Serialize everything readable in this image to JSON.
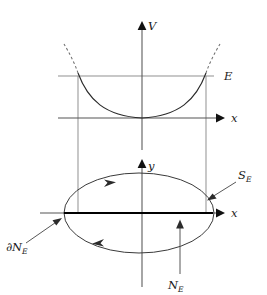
{
  "figure": {
    "name": "potential-well-and-energy-surface",
    "background_color": "#ffffff",
    "ink_color": "#1a1a1a",
    "width": 267,
    "height": 295
  },
  "upper_plot": {
    "name": "potential-energy-plot",
    "vertical_axis_label": "V",
    "horizontal_axis_label": "x",
    "energy_level_label": "E",
    "curve_name": "parabolic-potential",
    "curve_description": "upward-opening parabola with vertex at the origin",
    "dashed_extension": true,
    "origin": {
      "x": 142,
      "y": 118
    },
    "vertical_axis": {
      "x": 142,
      "y_top": 22,
      "y_bottom": 150
    },
    "horizontal_axis": {
      "y": 118,
      "x_left": 58,
      "x_right": 222
    },
    "energy_level_line": {
      "y": 76,
      "x_left": 58,
      "x_right": 214
    },
    "turning_points": {
      "left_x": 78,
      "right_x": 206
    }
  },
  "lower_plot": {
    "name": "configuration-space-plot",
    "vertical_axis_label": "y",
    "horizontal_axis_label": "x",
    "origin": {
      "x": 142,
      "y": 213
    },
    "vertical_axis": {
      "x": 142,
      "y_top": 160,
      "y_bottom": 287
    },
    "horizontal_axis": {
      "y": 213,
      "x_left": 40,
      "x_right": 222
    },
    "ellipse": {
      "name": "energy-surface-ellipse",
      "center_x": 139,
      "center_y": 213,
      "radius_x": 75,
      "radius_y": 40,
      "orientation": "clockwise",
      "top_arrow_direction": "right",
      "bottom_arrow_direction": "left"
    },
    "diameter": {
      "name": "boundary-diameter",
      "y": 213,
      "x_left": 64,
      "x_right": 213
    }
  },
  "connectors": {
    "name": "projection-lines",
    "left": {
      "x": 78,
      "y_top": 76,
      "y_bottom": 213
    },
    "right": {
      "x": 206,
      "y_top": 76,
      "y_bottom": 213
    }
  },
  "annotations": [
    {
      "name": "boundary-label",
      "base": "∂N",
      "subscript": "E",
      "label_x": 6,
      "label_y": 248,
      "pointer": {
        "from_x": 26,
        "from_y": 243,
        "to_x": 61,
        "to_y": 219
      }
    },
    {
      "name": "surface-label",
      "base": "S",
      "subscript": "E",
      "label_x": 238,
      "label_y": 180,
      "pointer": {
        "from_x": 235,
        "from_y": 183,
        "to_x": 209,
        "to_y": 199
      }
    },
    {
      "name": "region-label",
      "base": "N",
      "subscript": "E",
      "label_x": 168,
      "label_y": 286,
      "pointer": {
        "from_x": 180,
        "from_y": 274,
        "to_x": 180,
        "to_y": 221
      }
    }
  ]
}
